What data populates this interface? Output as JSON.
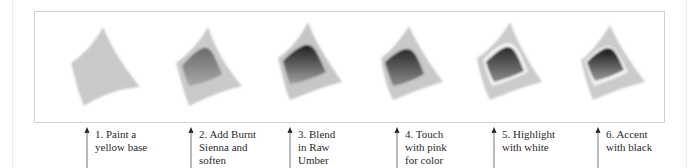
{
  "diagram": {
    "colors": {
      "frame_border": "#cfcfcf",
      "base_shape": "#c9c9c9",
      "label_text": "#2a2a2a",
      "arrow": "#555555"
    },
    "steps": [
      {
        "number": 1,
        "label": "1. Paint a\nyellow base"
      },
      {
        "number": 2,
        "label": "2. Add Burnt\nSienna and\nsoften"
      },
      {
        "number": 3,
        "label": "3. Blend\nin Raw\nUmber"
      },
      {
        "number": 4,
        "label": "4. Touch\nwith pink\nfor color"
      },
      {
        "number": 5,
        "label": "5. Highlight\nwith white"
      },
      {
        "number": 6,
        "label": "6. Accent\nwith black"
      }
    ]
  }
}
